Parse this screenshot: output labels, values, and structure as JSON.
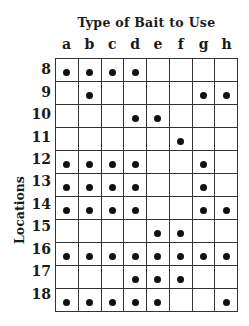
{
  "title": "Type of Bait to Use",
  "y_axis_label": "Locations",
  "columns": [
    "a",
    "b",
    "c",
    "d",
    "e",
    "f",
    "g",
    "h"
  ],
  "rows": [
    {
      "location": "8",
      "baits": [
        1,
        1,
        1,
        1,
        0,
        0,
        0,
        0
      ]
    },
    {
      "location": "9",
      "baits": [
        0,
        1,
        0,
        0,
        0,
        0,
        1,
        1
      ]
    },
    {
      "location": "10",
      "baits": [
        0,
        0,
        0,
        1,
        1,
        0,
        0,
        0
      ]
    },
    {
      "location": "11",
      "baits": [
        0,
        0,
        0,
        0,
        0,
        1,
        0,
        0
      ]
    },
    {
      "location": "12",
      "baits": [
        1,
        1,
        1,
        1,
        0,
        0,
        1,
        0
      ]
    },
    {
      "location": "13",
      "baits": [
        1,
        1,
        1,
        1,
        0,
        0,
        1,
        0
      ]
    },
    {
      "location": "14",
      "baits": [
        1,
        1,
        1,
        1,
        0,
        0,
        1,
        1
      ]
    },
    {
      "location": "15",
      "baits": [
        0,
        0,
        0,
        0,
        1,
        1,
        0,
        0
      ]
    },
    {
      "location": "16",
      "baits": [
        1,
        1,
        1,
        1,
        1,
        1,
        1,
        1
      ]
    },
    {
      "location": "17",
      "baits": [
        0,
        0,
        0,
        1,
        1,
        1,
        0,
        0
      ]
    },
    {
      "location": "18",
      "baits": [
        1,
        1,
        1,
        1,
        1,
        0,
        0,
        1
      ]
    }
  ],
  "marker_symbol": "filled-dot",
  "colors": {
    "ink": "#111111",
    "grid_line": "#333333",
    "background": "#ffffff"
  }
}
